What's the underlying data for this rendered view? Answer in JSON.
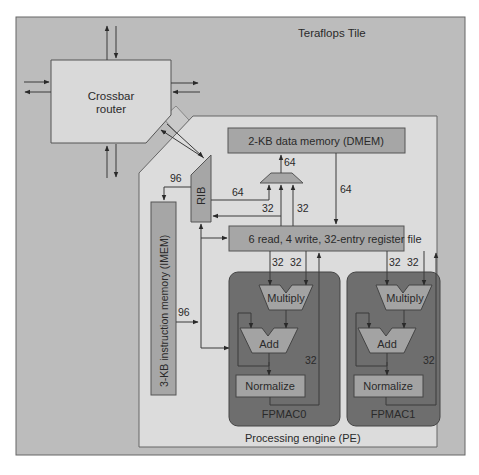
{
  "title": "Teraflops Tile",
  "colors": {
    "tile_bg": "#bcbcbc",
    "pe_bg": "#dcdcdc",
    "block": "#a6a6a6",
    "router": "#d9d9d9",
    "fpmac_bg": "#6e6e6e",
    "unit": "#a3a3a3",
    "border": "#555555"
  },
  "router": {
    "line1": "Crossbar",
    "line2": "router"
  },
  "pe": {
    "label": "Processing engine (PE)",
    "dmem": "2-KB data memory (DMEM)",
    "regfile": "6 read, 4 write, 32-entry register file",
    "imem": "3-KB instruction memory (IMEM)",
    "rib": "RIB"
  },
  "fpmac": [
    {
      "name": "FPMAC0",
      "multiply": "Multiply",
      "add": "Add",
      "normalize": "Normalize",
      "width": "32"
    },
    {
      "name": "FPMAC1",
      "multiply": "Multiply",
      "add": "Add",
      "normalize": "Normalize",
      "width": "32"
    }
  ],
  "bus_widths": {
    "rib_to_imem": "96",
    "imem_to_fpmac": "96",
    "rib_to_mux": "64",
    "mux_to_dmem": "64",
    "dmem_to_regfile": "64",
    "regfile_to_rib": "32",
    "regfile_to_mux": "32",
    "fpmac0_in_a": "32",
    "fpmac0_in_b": "32",
    "fpmac1_in_a": "32",
    "fpmac1_in_b": "32"
  }
}
